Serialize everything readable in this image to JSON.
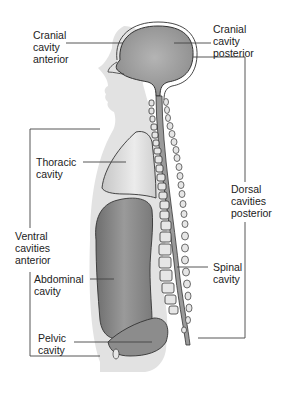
{
  "diagram": {
    "type": "anatomy",
    "labels": {
      "cranial_anterior": "Cranial\ncavity\nanterior",
      "cranial_posterior": "Cranial\ncavity\nposterior",
      "thoracic": "Thoracic\ncavity",
      "ventral": "Ventral\ncavities\nanterior",
      "dorsal": "Dorsal\ncavities\nposterior",
      "abdominal": "Abdominal\ncavity",
      "spinal": "Spinal\ncavity",
      "pelvic": "Pelvic\ncavity"
    },
    "colors": {
      "body_silhouette": "#e2e2e2",
      "cavity_fill": "#9a9a9a",
      "thoracic_fill": "#d4d4d4",
      "abdominal_fill": "#8e8e8e",
      "outline": "#333333",
      "leader_line": "#444444"
    }
  }
}
